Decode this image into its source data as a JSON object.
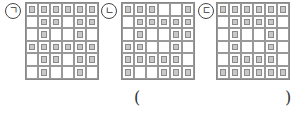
{
  "figures": [
    {
      "label": "ㄱ",
      "cells": [
        [
          1,
          1,
          1,
          1,
          1,
          1
        ],
        [
          0,
          1,
          1,
          0,
          1,
          1
        ],
        [
          0,
          1,
          0,
          0,
          1,
          0
        ],
        [
          1,
          1,
          1,
          1,
          1,
          1
        ],
        [
          0,
          1,
          1,
          0,
          1,
          1
        ],
        [
          0,
          1,
          0,
          0,
          1,
          0
        ]
      ]
    },
    {
      "label": "ㄴ",
      "cells": [
        [
          1,
          1,
          1,
          0,
          0,
          1
        ],
        [
          0,
          1,
          1,
          1,
          1,
          1
        ],
        [
          0,
          1,
          0,
          0,
          1,
          1
        ],
        [
          1,
          1,
          0,
          0,
          1,
          0
        ],
        [
          1,
          1,
          1,
          1,
          1,
          0
        ],
        [
          1,
          0,
          0,
          1,
          1,
          1
        ]
      ]
    },
    {
      "label": "ㄷ",
      "cells": [
        [
          1,
          1,
          1,
          1,
          1,
          1
        ],
        [
          0,
          1,
          1,
          1,
          1,
          0
        ],
        [
          0,
          1,
          0,
          0,
          1,
          0
        ],
        [
          0,
          1,
          0,
          0,
          1,
          0
        ],
        [
          0,
          1,
          1,
          1,
          1,
          0
        ],
        [
          1,
          1,
          1,
          1,
          1,
          1
        ]
      ]
    }
  ],
  "answer": {
    "open": "(",
    "close": ")",
    "value": ""
  }
}
